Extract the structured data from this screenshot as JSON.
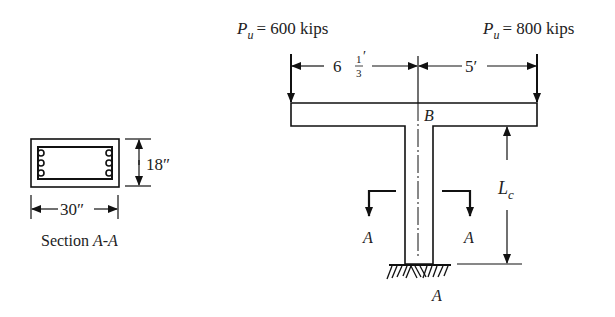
{
  "section": {
    "width_label": "30″",
    "height_label": "18″",
    "caption_prefix": "Section ",
    "caption_name": "A-A"
  },
  "loads": {
    "left": {
      "symbol": "P",
      "subscript": "u",
      "equals": "= 600 kips"
    },
    "right": {
      "symbol": "P",
      "subscript": "u",
      "equals": "= 800 kips"
    }
  },
  "dimensions": {
    "left_whole": "6",
    "left_num": "1",
    "left_den": "3",
    "left_prime": "′",
    "right": "5′",
    "column_symbol": "L",
    "column_subscript": "c"
  },
  "points": {
    "joint": "B",
    "base": "A",
    "cut_left": "A",
    "cut_right": "A"
  }
}
